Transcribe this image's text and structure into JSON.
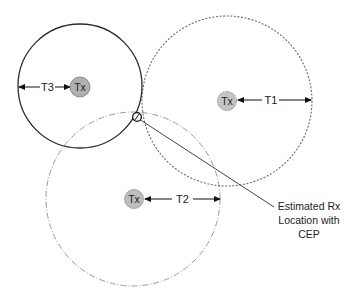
{
  "diagram": {
    "type": "trilateration",
    "colors": {
      "stroke_solid": "#333333",
      "stroke_dashed": "#777777",
      "stroke_dashdot": "#999999",
      "tx_fill": "#b5b5b5",
      "text": "#222222"
    },
    "transmitters": [
      {
        "id": "t3",
        "label": "Tx",
        "range_label": "T3",
        "circle_style": "solid"
      },
      {
        "id": "t1",
        "label": "Tx",
        "range_label": "T1",
        "circle_style": "dashed"
      },
      {
        "id": "t2",
        "label": "Tx",
        "range_label": "T2",
        "circle_style": "dash-dot"
      }
    ],
    "annotation": {
      "line1": "Estimated Rx",
      "line2": "Location with",
      "line3": "CEP"
    }
  }
}
